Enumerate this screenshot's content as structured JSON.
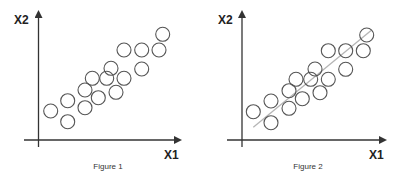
{
  "figures": [
    {
      "caption": "Figure 1",
      "x_label": "X1",
      "y_label": "X2",
      "has_fit_line": false
    },
    {
      "caption": "Figure 2",
      "x_label": "X1",
      "y_label": "X2",
      "has_fit_line": true
    }
  ],
  "colors": {
    "axis": "#333333",
    "point_stroke": "#555555",
    "fit_line": "#b5b5b5",
    "background": "#ffffff"
  },
  "chart_data": [
    {
      "type": "scatter",
      "title": "Figure 1",
      "xlabel": "X1",
      "ylabel": "X2",
      "marker": "hollow-circle",
      "points_px": [
        [
          50.7,
          111
        ],
        [
          67.7,
          100.7
        ],
        [
          67.7,
          121.7
        ],
        [
          85,
          90
        ],
        [
          85,
          107.7
        ],
        [
          92.3,
          78.3
        ],
        [
          98.3,
          97.7
        ],
        [
          106.7,
          78.3
        ],
        [
          111,
          68.3
        ],
        [
          116,
          92.3
        ],
        [
          124,
          78.3
        ],
        [
          124,
          50
        ],
        [
          141.7,
          50
        ],
        [
          141.7,
          69
        ],
        [
          159,
          50
        ],
        [
          162.7,
          34.3
        ]
      ],
      "grid": false
    },
    {
      "type": "scatter",
      "title": "Figure 2",
      "xlabel": "X1",
      "ylabel": "X2",
      "marker": "hollow-circle",
      "points_px": [
        [
          253.3,
          111.7
        ],
        [
          271,
          101
        ],
        [
          271,
          122.7
        ],
        [
          289,
          90.7
        ],
        [
          289,
          108.3
        ],
        [
          296,
          79.3
        ],
        [
          302.3,
          98.7
        ],
        [
          310.7,
          79.3
        ],
        [
          315,
          69
        ],
        [
          320,
          92.7
        ],
        [
          328.3,
          79.3
        ],
        [
          328.3,
          50.7
        ],
        [
          345.7,
          50.7
        ],
        [
          345.7,
          69.3
        ],
        [
          363.3,
          50.7
        ],
        [
          366.7,
          35
        ]
      ],
      "fit_line_px": [
        [
          253.3,
          127.3
        ],
        [
          371.7,
          30
        ]
      ],
      "grid": false
    }
  ]
}
